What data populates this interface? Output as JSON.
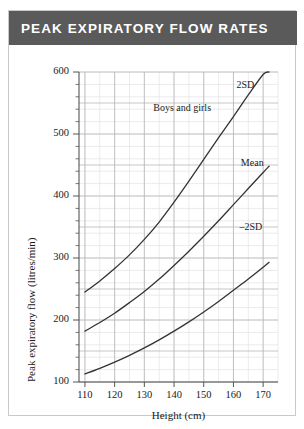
{
  "card": {
    "title": "PEAK EXPIRATORY FLOW RATES",
    "header_color": "#5a5a5a",
    "header_text_color": "#ffffff",
    "border_color": "#c9c9c9"
  },
  "chart_data": {
    "type": "line",
    "title": "PEAK EXPIRATORY FLOW RATES",
    "xlabel": "Height (cm)",
    "ylabel": "Peak expiratory flow (litres/min)",
    "xlim": [
      108,
      175
    ],
    "ylim": [
      100,
      600
    ],
    "x_ticks": [
      110,
      120,
      130,
      140,
      150,
      160,
      170
    ],
    "y_ticks": [
      100,
      200,
      300,
      400,
      500,
      600
    ],
    "x_minor_step": 5,
    "y_minor_step": 20,
    "grid": true,
    "legend": "none",
    "line_color": "#333333",
    "grid_major_color": "#b8b8b8",
    "grid_minor_color": "#e2e2e2",
    "annotations": [
      {
        "text": "Boys and girls",
        "x": 133,
        "y": 540
      },
      {
        "text": "2SD",
        "x": 161,
        "y": 578
      },
      {
        "text": "Mean",
        "x": 162.5,
        "y": 452
      },
      {
        "text": "–2SD",
        "x": 162,
        "y": 348
      }
    ],
    "x": [
      110,
      115,
      120,
      125,
      130,
      135,
      140,
      145,
      150,
      155,
      160,
      165,
      170,
      172
    ],
    "series": [
      {
        "name": "2SD",
        "label": "2SD",
        "values": [
          245,
          263,
          283,
          305,
          330,
          358,
          390,
          424,
          459,
          494,
          528,
          563,
          596,
          600
        ]
      },
      {
        "name": "Mean",
        "label": "Mean",
        "values": [
          182,
          196,
          211,
          228,
          246,
          266,
          288,
          311,
          335,
          360,
          386,
          412,
          438,
          448
        ]
      },
      {
        "name": "-2SD",
        "label": "–2SD",
        "values": [
          113,
          122,
          132,
          143,
          155,
          168,
          182,
          197,
          213,
          230,
          248,
          266,
          285,
          293
        ]
      }
    ]
  }
}
